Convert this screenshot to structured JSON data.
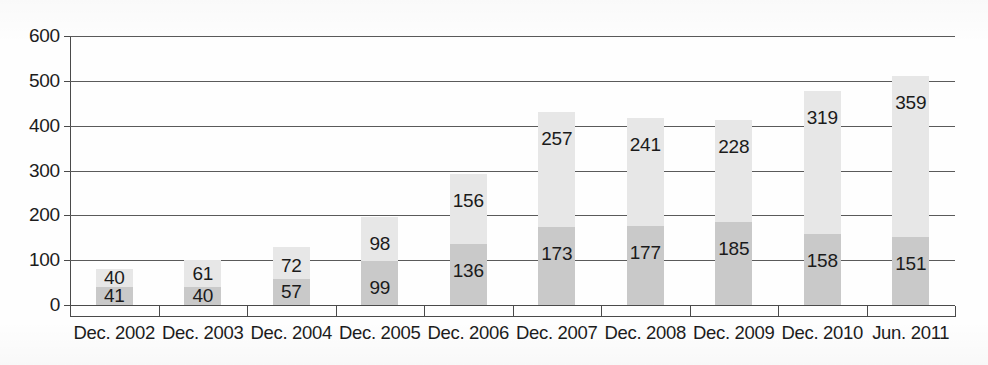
{
  "chart_data": {
    "type": "bar",
    "stacked": true,
    "title": "",
    "subtitle": "",
    "xlabel": "",
    "ylabel": "",
    "ylim": [
      0,
      600
    ],
    "ytick_step": 100,
    "ytick_labels": [
      "600",
      "500",
      "400",
      "300",
      "200",
      "100",
      "0"
    ],
    "grid": true,
    "legend": "none",
    "categories": [
      "Dec. 2002",
      "Dec. 2003",
      "Dec. 2004",
      "Dec. 2005",
      "Dec. 2006",
      "Dec. 2007",
      "Dec. 2008",
      "Dec. 2009",
      "Dec. 2010",
      "Jun. 2011"
    ],
    "series": [
      {
        "name": "lower-segment",
        "color": "#c9c9c9",
        "values": [
          41,
          40,
          57,
          99,
          136,
          173,
          177,
          185,
          158,
          151
        ]
      },
      {
        "name": "upper-segment",
        "color": "#e7e7e7",
        "values": [
          40,
          61,
          72,
          98,
          156,
          257,
          241,
          228,
          319,
          359
        ]
      }
    ],
    "totals": [
      81,
      101,
      129,
      197,
      292,
      430,
      418,
      413,
      477,
      510
    ]
  }
}
